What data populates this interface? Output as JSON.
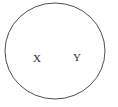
{
  "diagram": {
    "type": "set-diagram",
    "title": "",
    "background_color": "#ffffff",
    "circle": {
      "name": "universal-set-circle",
      "stroke_color": "#3a3a3a",
      "fill_color": "#ffffff",
      "stroke_width": 0.9,
      "center_x": 55,
      "center_y": 51,
      "radius_x": 50,
      "radius_y": 48
    },
    "labels": [
      {
        "id": "x",
        "text": "X",
        "color": "#2b2b2b",
        "x": 37,
        "y": 59
      },
      {
        "id": "y",
        "text": "Y",
        "color": "#2b2b2b",
        "x": 77,
        "y": 58
      }
    ]
  }
}
